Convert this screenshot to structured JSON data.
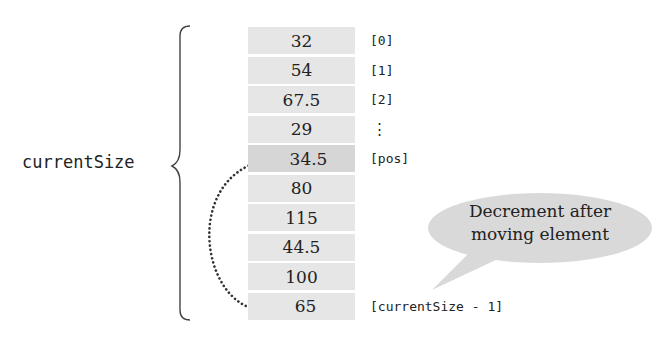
{
  "diagram": {
    "variable_label": "currentSize",
    "cells": [
      {
        "value": "32",
        "index": "[0]"
      },
      {
        "value": "54",
        "index": "[1]"
      },
      {
        "value": "67.5",
        "index": "[2]"
      },
      {
        "value": "29",
        "index": "⋮"
      },
      {
        "value": "34.5",
        "index": "[pos]",
        "highlight": true
      },
      {
        "value": "80",
        "index": ""
      },
      {
        "value": "115",
        "index": ""
      },
      {
        "value": "44.5",
        "index": ""
      },
      {
        "value": "100",
        "index": ""
      },
      {
        "value": "65",
        "index": "[currentSize - 1]"
      }
    ],
    "callout": {
      "line1": "Decrement after",
      "line2": "moving element"
    },
    "arrow": {
      "from_index": "[currentSize - 1]",
      "to_index": "[pos]",
      "style": "dotted"
    },
    "colors": {
      "cell_fill": "#e6e6e6",
      "cell_highlight": "#d6d6d6",
      "callout_fill": "#d9d9d9",
      "stroke": "#333333"
    }
  }
}
